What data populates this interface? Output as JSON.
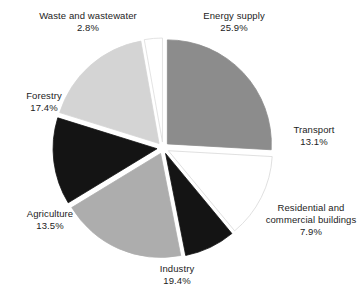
{
  "chart_data": {
    "type": "pie",
    "title": "",
    "subtitle": "",
    "xlabel": "",
    "ylabel": "",
    "legend_position": "none",
    "grid": false,
    "units": "percent",
    "exploded": true,
    "start_angle_deg": 0,
    "direction": "clockwise",
    "categories": [
      "Energy supply",
      "Transport",
      "Residential and commercial buildings",
      "Industry",
      "Agriculture",
      "Forestry",
      "Waste and wastewater"
    ],
    "values": [
      25.9,
      13.1,
      7.9,
      19.4,
      13.5,
      17.4,
      2.8
    ],
    "slices": [
      {
        "name": "Energy supply",
        "label_lines": [
          "Energy supply"
        ],
        "value": 25.9,
        "value_text": "25.9%",
        "color": "#8c8c8c",
        "stroke": "#8c8c8c"
      },
      {
        "name": "Transport",
        "label_lines": [
          "Transport"
        ],
        "value": 13.1,
        "value_text": "13.1%",
        "color": "#ffffff",
        "stroke": "#d8d8d8"
      },
      {
        "name": "Residential and commercial buildings",
        "label_lines": [
          "Residential and",
          "commercial",
          "buildings"
        ],
        "value": 7.9,
        "value_text": "7.9%",
        "color": "#141414",
        "stroke": "#141414"
      },
      {
        "name": "Industry",
        "label_lines": [
          "Industry"
        ],
        "value": 19.4,
        "value_text": "19.4%",
        "color": "#adadad",
        "stroke": "#adadad"
      },
      {
        "name": "Agriculture",
        "label_lines": [
          "Agriculture"
        ],
        "value": 13.5,
        "value_text": "13.5%",
        "color": "#141414",
        "stroke": "#141414"
      },
      {
        "name": "Forestry",
        "label_lines": [
          "Forestry"
        ],
        "value": 17.4,
        "value_text": "17.4%",
        "color": "#d4d4d4",
        "stroke": "#d4d4d4"
      },
      {
        "name": "Waste and wastewater",
        "label_lines": [
          "Waste and",
          "wastewater"
        ],
        "value": 2.8,
        "value_text": "2.8%",
        "color": "#ffffff",
        "stroke": "#dcdcdc"
      }
    ]
  },
  "labels": {
    "energy": {
      "name": "Energy supply",
      "value": "25.9%"
    },
    "transport": {
      "name": "Transport",
      "value": "13.1%"
    },
    "residential": {
      "name": "Residential and commercial buildings",
      "value": "7.9%"
    },
    "industry": {
      "name": "Industry",
      "value": "19.4%"
    },
    "agriculture": {
      "name": "Agriculture",
      "value": "13.5%"
    },
    "forestry": {
      "name": "Forestry",
      "value": "17.4%"
    },
    "waste": {
      "name": "Waste and wastewater",
      "value": "2.8%"
    }
  },
  "geometry": {
    "center_x": 163,
    "center_y": 148,
    "radius": 104,
    "explode_offset": 6
  }
}
